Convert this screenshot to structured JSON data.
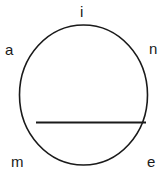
{
  "figure": {
    "background_color": "#ffffff",
    "stroke_color": "#1a1a1a",
    "width": 168,
    "height": 178,
    "shapes": {
      "circle": {
        "name": "circle-outline",
        "center_x": 83.5,
        "center_y": 95,
        "radius_x": 64,
        "radius_y": 70,
        "stroke_width": 1.6,
        "fill": "none"
      },
      "chord": {
        "name": "horizontal-chord",
        "x1": 36,
        "y1": 122.5,
        "x2": 146,
        "y2": 122.5,
        "stroke_width": 1.8
      }
    },
    "labels": [
      {
        "id": "i",
        "text": "i",
        "position": "top",
        "x": 85,
        "y": 11
      },
      {
        "id": "a",
        "text": "a",
        "position": "upper-left",
        "x": 10,
        "y": 50
      },
      {
        "id": "n",
        "text": "n",
        "position": "upper-right",
        "x": 155,
        "y": 48
      },
      {
        "id": "m",
        "text": "m",
        "position": "lower-left",
        "x": 19,
        "y": 162
      },
      {
        "id": "e",
        "text": "e",
        "position": "lower-right",
        "x": 153,
        "y": 162
      }
    ]
  }
}
